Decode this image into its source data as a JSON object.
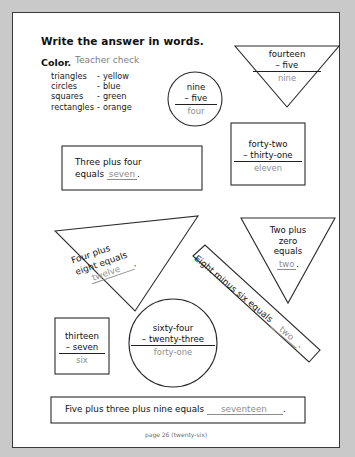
{
  "worksheet": {
    "instruction": "Write the answer in words.",
    "color_label": "Color.",
    "teacher_note": "Teacher check",
    "legend": [
      {
        "shape": "triangles",
        "dash": "-",
        "color": "yellow"
      },
      {
        "shape": "circles",
        "dash": "-",
        "color": "blue"
      },
      {
        "shape": "squares",
        "dash": "-",
        "color": "green"
      },
      {
        "shape": "rectangles",
        "dash": "-",
        "color": "orange"
      }
    ],
    "footer": "page 26 (twenty-six)"
  },
  "problems": {
    "circle_nine": {
      "shape": "circle",
      "top": "nine",
      "operator": "–",
      "bottom": "five",
      "answer": "four"
    },
    "triangle_fourteen": {
      "shape": "triangle-down",
      "top": "fourteen",
      "operator": "–",
      "bottom": "five",
      "answer": "nine"
    },
    "square_fortytwo": {
      "shape": "square",
      "top": "forty-two",
      "operator": "–",
      "bottom": "thirty-one",
      "answer": "eleven"
    },
    "rect_three_plus_four": {
      "shape": "rectangle",
      "text_before": "Three plus four",
      "text_equals": "equals",
      "answer": "seven",
      "period": "."
    },
    "triangle_four_plus_eight": {
      "shape": "triangle-rotated",
      "line1": "Four plus",
      "line2": "eight equals",
      "answer": "twelve",
      "period": "."
    },
    "triangle_two_plus_zero": {
      "shape": "triangle-down",
      "line1": "Two plus",
      "line2": "zero",
      "line3": "equals",
      "answer": "two",
      "period": "."
    },
    "rect_eight_minus_six": {
      "shape": "rectangle-diagonal",
      "text": "Eight minus six equals",
      "answer": "two",
      "period": "."
    },
    "circle_sixtyfour": {
      "shape": "circle",
      "top": "sixty-four",
      "operator": "–",
      "bottom": "twenty-three",
      "answer": "forty-one"
    },
    "square_thirteen": {
      "shape": "square",
      "top": "thirteen",
      "operator": "–",
      "bottom": "seven",
      "answer": "six"
    },
    "rect_bottom": {
      "shape": "rectangle",
      "text": "Five plus three plus nine equals",
      "answer": "seventeen",
      "period": "."
    }
  },
  "colors": {
    "ink": "#101010",
    "handwriting": "#8d8d8d",
    "border": "#3a3a3a",
    "page_bg": "#ffffff",
    "outer_bg": "#c9c9c9"
  }
}
